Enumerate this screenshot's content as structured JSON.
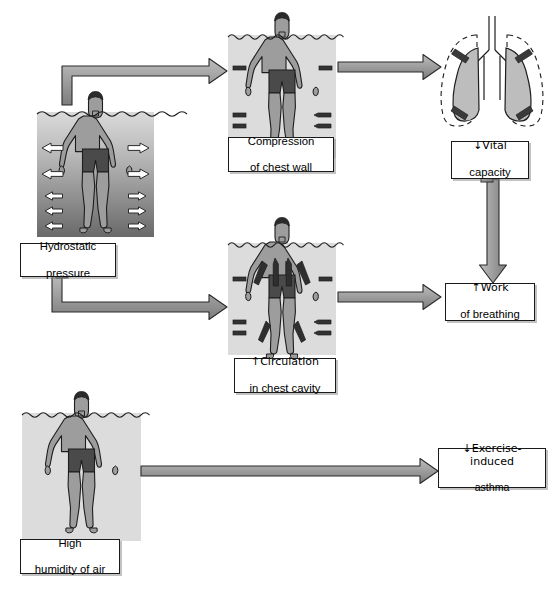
{
  "diagram": {
    "type": "flowchart",
    "background": "#ffffff",
    "palette": {
      "skin": "#9d9d9d",
      "shorts": "#4a4a4a",
      "hair": "#2b2b2b",
      "outline": "#1d1d1d",
      "water_flat": "#dcdcdc",
      "water_gradient_top": "#d8d8d8",
      "water_gradient_bottom": "#6e6e6e",
      "arrow_fill_light": "#c9c9c9",
      "arrow_fill_dark": "#8c8c8c",
      "arrow_stroke": "#2a2a2a",
      "lung_fill": "#bdbdbd",
      "box_border": "#1a1a1a",
      "box_fill": "#ffffff"
    },
    "nodes": [
      {
        "id": "hydrostatic",
        "kind": "figure-with-caption",
        "caption_lines": [
          "Hydrostatic",
          "pressure"
        ],
        "figure": "swimmer-in-graded-water",
        "annotation": "five white outlined arrows pressing inward on each side, increasing with depth"
      },
      {
        "id": "compression",
        "kind": "figure-with-caption",
        "caption_lines": [
          "Compression",
          "of chest wall"
        ],
        "figure": "swimmer-with-short-inward-marks",
        "annotation": "short dark inward arrows at chest and legs"
      },
      {
        "id": "circulation",
        "kind": "figure-with-caption",
        "caption_lines": [
          "↑Circulation",
          "in chest cavity"
        ],
        "figure": "swimmer-with-upward-flow-arrows",
        "annotation": "dark arrows directed upward through limbs and trunk"
      },
      {
        "id": "humidity",
        "kind": "figure-with-caption",
        "caption_lines": [
          "High",
          "humidity of air"
        ],
        "figure": "swimmer-in-flat-water",
        "annotation": "swimmer standing in water, no pressure arrows"
      },
      {
        "id": "vital-capacity",
        "kind": "outcome-with-icon",
        "caption_lines": [
          "↓Vital",
          "capacity"
        ],
        "figure": "lungs-compressed",
        "annotation": "dashed normal lung outline with smaller shaded lungs and inward arrows"
      },
      {
        "id": "work-of-breathing",
        "kind": "outcome",
        "caption_lines": [
          "↑Work",
          "of breathing"
        ]
      },
      {
        "id": "exercise-induced-asthma",
        "kind": "outcome",
        "caption_lines": [
          "↓Exercise-induced",
          "asthma"
        ]
      }
    ],
    "edges": [
      {
        "id": "e1",
        "from": "hydrostatic",
        "to": "compression",
        "style": "elbow-up-right"
      },
      {
        "id": "e2",
        "from": "hydrostatic",
        "to": "circulation",
        "style": "elbow-down-right"
      },
      {
        "id": "e3",
        "from": "compression",
        "to": "vital-capacity",
        "style": "straight-right"
      },
      {
        "id": "e4",
        "from": "circulation",
        "to": "work-of-breathing",
        "style": "straight-right"
      },
      {
        "id": "e5",
        "from": "vital-capacity",
        "to": "work-of-breathing",
        "style": "straight-down"
      },
      {
        "id": "e6",
        "from": "humidity",
        "to": "exercise-induced-asthma",
        "style": "straight-right"
      }
    ]
  }
}
